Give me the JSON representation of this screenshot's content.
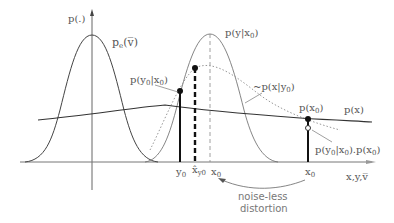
{
  "diagram": {
    "title": "",
    "axes": {
      "y_label": "p(.)",
      "x_label": "x,y,v̅"
    },
    "curves": [
      {
        "name": "noise-pdf",
        "label": "p_e(v̅)",
        "style": "solid-thin"
      },
      {
        "name": "likelihood",
        "label": "p(y|x0)",
        "style": "solid-thin"
      },
      {
        "name": "posterior-approx",
        "label": "~p(x|y0)",
        "style": "dotted"
      },
      {
        "name": "prior",
        "label": "p(x)",
        "style": "solid"
      }
    ],
    "markers": {
      "y0": "y0",
      "xhat": "x̂y0",
      "x0_left": "x0",
      "x0_right": "x0"
    },
    "labels": {
      "pe": "p",
      "pe_sub": "e",
      "pe_arg": "(v̅)",
      "pyx0": "p(y|x",
      "pyx0_sub": "0",
      "pyx0_close": ")",
      "px_y0_a": "~p(x|y",
      "px_y0_sub": "0",
      "px_y0_close": ")",
      "py0x0_a": "p(y",
      "py0x0_s1": "0",
      "py0x0_b": "|x",
      "py0x0_s2": "0",
      "py0x0_c": ")",
      "px0_a": "p(x",
      "px0_sub": "0",
      "px0_c": ")",
      "px": "p(x)",
      "product_a": "p(y",
      "product_s1": "0",
      "product_b": "|x",
      "product_s2": "0",
      "product_c": ").p(x",
      "product_s3": "0",
      "product_d": ")",
      "y_axis": "p(.)",
      "x_axis": "x,y,v̅",
      "tick_y0": "y",
      "tick_y0_sub": "0",
      "tick_xhat": "x̂",
      "tick_xhat_sub": "y0",
      "tick_x0a": "x",
      "tick_x0a_sub": "0",
      "tick_x0b": "x",
      "tick_x0b_sub": "0",
      "annotation_line1": "noise-less",
      "annotation_line2": "distortion"
    },
    "colors": {
      "axis": "#555555",
      "curve": "#444444",
      "dotted": "#888888",
      "marker": "#111111",
      "text": "#555555"
    }
  }
}
